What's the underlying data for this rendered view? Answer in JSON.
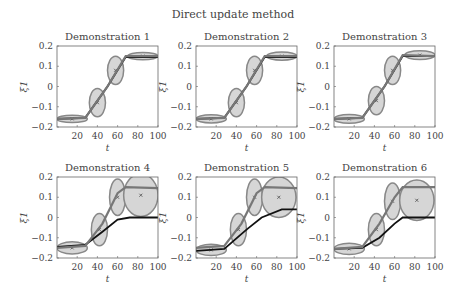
{
  "figure": {
    "suptitle": "Direct update method"
  },
  "chart_data": [
    {
      "type": "line",
      "title": "Demonstration 1",
      "xlabel": "t",
      "ylabel": "ξ1",
      "xlim": [
        0,
        100
      ],
      "ylim": [
        -0.2,
        0.2
      ],
      "xticks": [
        20,
        40,
        60,
        80,
        100
      ],
      "yticks": [
        0.2,
        0.1,
        0,
        -0.1,
        -0.2
      ],
      "series": [
        {
          "name": "demonstration",
          "x": [
            0,
            28,
            50,
            68,
            100
          ],
          "y": [
            -0.16,
            -0.155,
            0.0,
            0.145,
            0.145
          ]
        },
        {
          "name": "reproduction",
          "x": [
            0,
            28,
            50,
            68,
            100
          ],
          "y": [
            -0.16,
            -0.155,
            0.0,
            0.15,
            0.15
          ]
        }
      ],
      "gaussians": [
        {
          "cx": 15,
          "cy": -0.16,
          "rx": 15,
          "ry": 0.018
        },
        {
          "cx": 40,
          "cy": -0.08,
          "rx": 8,
          "ry": 0.07
        },
        {
          "cx": 58,
          "cy": 0.08,
          "rx": 8,
          "ry": 0.07
        },
        {
          "cx": 85,
          "cy": 0.15,
          "rx": 15,
          "ry": 0.018
        }
      ]
    },
    {
      "type": "line",
      "title": "Demonstration 2",
      "xlabel": "t",
      "ylabel": "ξ1",
      "xlim": [
        0,
        100
      ],
      "ylim": [
        -0.2,
        0.2
      ],
      "xticks": [
        20,
        40,
        60,
        80,
        100
      ],
      "yticks": [
        0.2,
        0.1,
        0,
        -0.1,
        -0.2
      ],
      "series": [
        {
          "name": "demonstration",
          "x": [
            0,
            28,
            50,
            68,
            100
          ],
          "y": [
            -0.16,
            -0.155,
            0.0,
            0.145,
            0.145
          ]
        },
        {
          "name": "reproduction",
          "x": [
            0,
            28,
            50,
            68,
            100
          ],
          "y": [
            -0.16,
            -0.155,
            0.0,
            0.15,
            0.15
          ]
        }
      ],
      "gaussians": [
        {
          "cx": 15,
          "cy": -0.16,
          "rx": 15,
          "ry": 0.02
        },
        {
          "cx": 40,
          "cy": -0.08,
          "rx": 8,
          "ry": 0.07
        },
        {
          "cx": 58,
          "cy": 0.08,
          "rx": 8,
          "ry": 0.07
        },
        {
          "cx": 85,
          "cy": 0.15,
          "rx": 15,
          "ry": 0.02
        }
      ]
    },
    {
      "type": "line",
      "title": "Demonstration 3",
      "xlabel": "t",
      "ylabel": "ξ1",
      "xlim": [
        0,
        100
      ],
      "ylim": [
        -0.2,
        0.2
      ],
      "xticks": [
        20,
        40,
        60,
        80,
        100
      ],
      "yticks": [
        0.2,
        0.1,
        0,
        -0.1,
        -0.2
      ],
      "series": [
        {
          "name": "demonstration",
          "x": [
            0,
            28,
            50,
            68,
            100
          ],
          "y": [
            -0.16,
            -0.155,
            0.0,
            0.15,
            0.15
          ]
        },
        {
          "name": "reproduction",
          "x": [
            0,
            28,
            50,
            68,
            100
          ],
          "y": [
            -0.16,
            -0.155,
            0.0,
            0.155,
            0.15
          ]
        }
      ],
      "gaussians": [
        {
          "cx": 15,
          "cy": -0.16,
          "rx": 15,
          "ry": 0.022
        },
        {
          "cx": 42,
          "cy": -0.07,
          "rx": 8,
          "ry": 0.07
        },
        {
          "cx": 58,
          "cy": 0.08,
          "rx": 8,
          "ry": 0.07
        },
        {
          "cx": 85,
          "cy": 0.155,
          "rx": 15,
          "ry": 0.022
        }
      ]
    },
    {
      "type": "line",
      "title": "Demonstration 4",
      "xlabel": "t",
      "ylabel": "ξ1",
      "xlim": [
        0,
        100
      ],
      "ylim": [
        -0.2,
        0.2
      ],
      "xticks": [
        20,
        40,
        60,
        80,
        100
      ],
      "yticks": [
        0.2,
        0.1,
        0,
        -0.1,
        -0.2
      ],
      "series": [
        {
          "name": "demonstration",
          "x": [
            0,
            28,
            45,
            60,
            72,
            100
          ],
          "y": [
            -0.145,
            -0.135,
            -0.07,
            -0.01,
            0.0,
            0.0
          ]
        },
        {
          "name": "reproduction",
          "x": [
            0,
            28,
            45,
            60,
            68,
            100
          ],
          "y": [
            -0.15,
            -0.14,
            -0.03,
            0.12,
            0.15,
            0.145
          ]
        }
      ],
      "gaussians": [
        {
          "cx": 15,
          "cy": -0.15,
          "rx": 15,
          "ry": 0.03
        },
        {
          "cx": 42,
          "cy": -0.06,
          "rx": 8,
          "ry": 0.08
        },
        {
          "cx": 60,
          "cy": 0.1,
          "rx": 8,
          "ry": 0.09
        },
        {
          "cx": 83,
          "cy": 0.11,
          "rx": 17,
          "ry": 0.105
        }
      ]
    },
    {
      "type": "line",
      "title": "Demonstration 5",
      "xlabel": "t",
      "ylabel": "ξ1",
      "xlim": [
        0,
        100
      ],
      "ylim": [
        -0.2,
        0.2
      ],
      "xticks": [
        20,
        40,
        60,
        80,
        100
      ],
      "yticks": [
        0.2,
        0.1,
        0,
        -0.1,
        -0.2
      ],
      "series": [
        {
          "name": "demonstration",
          "x": [
            0,
            28,
            50,
            65,
            85,
            100
          ],
          "y": [
            -0.165,
            -0.155,
            -0.06,
            0.0,
            0.04,
            0.04
          ]
        },
        {
          "name": "reproduction",
          "x": [
            0,
            28,
            45,
            60,
            68,
            100
          ],
          "y": [
            -0.15,
            -0.14,
            -0.03,
            0.12,
            0.15,
            0.145
          ]
        }
      ],
      "gaussians": [
        {
          "cx": 15,
          "cy": -0.16,
          "rx": 15,
          "ry": 0.028
        },
        {
          "cx": 42,
          "cy": -0.06,
          "rx": 8,
          "ry": 0.08
        },
        {
          "cx": 58,
          "cy": 0.1,
          "rx": 8,
          "ry": 0.09
        },
        {
          "cx": 82,
          "cy": 0.1,
          "rx": 17,
          "ry": 0.1
        }
      ]
    },
    {
      "type": "line",
      "title": "Demonstration 6",
      "xlabel": "t",
      "ylabel": "ξ1",
      "xlim": [
        0,
        100
      ],
      "ylim": [
        -0.2,
        0.2
      ],
      "xticks": [
        20,
        40,
        60,
        80,
        100
      ],
      "yticks": [
        0.2,
        0.1,
        0,
        -0.1,
        -0.2
      ],
      "series": [
        {
          "name": "demonstration",
          "x": [
            0,
            28,
            45,
            60,
            68,
            100
          ],
          "y": [
            -0.155,
            -0.15,
            -0.1,
            -0.03,
            0.0,
            0.0
          ]
        },
        {
          "name": "reproduction",
          "x": [
            0,
            28,
            45,
            60,
            68,
            100
          ],
          "y": [
            -0.155,
            -0.145,
            -0.03,
            0.1,
            0.15,
            0.15
          ]
        }
      ],
      "gaussians": [
        {
          "cx": 15,
          "cy": -0.155,
          "rx": 15,
          "ry": 0.028
        },
        {
          "cx": 42,
          "cy": -0.06,
          "rx": 8,
          "ry": 0.08
        },
        {
          "cx": 58,
          "cy": 0.08,
          "rx": 8,
          "ry": 0.09
        },
        {
          "cx": 82,
          "cy": 0.085,
          "rx": 17,
          "ry": 0.1
        }
      ]
    }
  ]
}
